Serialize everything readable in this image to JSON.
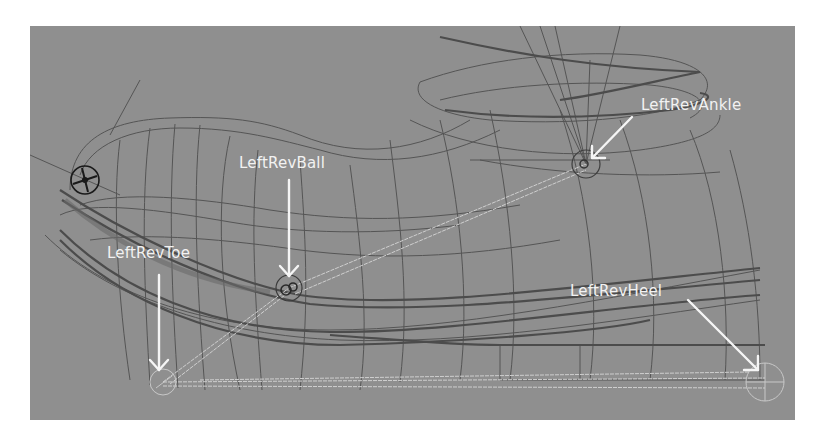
{
  "viewport": {
    "background": "#8f8f8f",
    "mode": "wireframe"
  },
  "joints": [
    {
      "id": "ankle",
      "label": "LeftRevAnkle"
    },
    {
      "id": "ball",
      "label": "LeftRevBall"
    },
    {
      "id": "toe",
      "label": "LeftRevToe"
    },
    {
      "id": "heel",
      "label": "LeftRevHeel"
    }
  ],
  "colors": {
    "wire_dark": "#4a4a4a",
    "wire_mid": "#5e5e5e",
    "joint_light": "#cfcfcf",
    "annotation": "#f5f5f5",
    "locator": "#1a1a1a"
  }
}
